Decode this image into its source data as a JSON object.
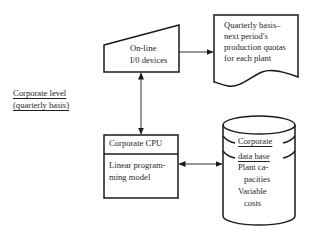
{
  "side_label": {
    "line1": "Corporate level",
    "line2": "(quarterly basis)"
  },
  "io_devices": {
    "shape": "manual-input-trapezoid",
    "line1": "On-line",
    "line2": "I/0 devices"
  },
  "report": {
    "shape": "document",
    "line1": "Quarterly basis–",
    "line2": "next period's",
    "line3": "production quotas",
    "line4": "for each plant"
  },
  "cpu": {
    "shape": "process-box",
    "title": "Corporate CPU",
    "line1": "Linear program-",
    "line2": "ming model"
  },
  "database": {
    "shape": "cylinder",
    "title_line1": "Corporate",
    "title_line2": "data base",
    "line1": "Plant ca-",
    "line2": "pacities",
    "line3": "Variable",
    "line4": "costs"
  },
  "connectors": [
    {
      "from": "io_devices",
      "to": "report",
      "direction": "one-way"
    },
    {
      "from": "io_devices",
      "to": "cpu",
      "direction": "two-way"
    },
    {
      "from": "cpu",
      "to": "database",
      "direction": "two-way"
    }
  ],
  "colors": {
    "stroke": "#1a1a1a",
    "background": "#ffffff"
  }
}
